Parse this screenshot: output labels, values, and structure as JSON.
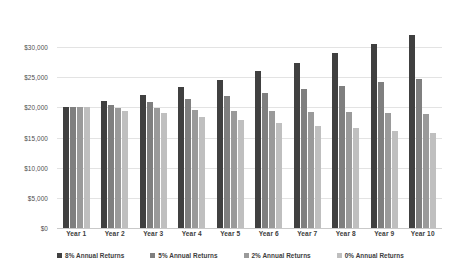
{
  "chart_data": {
    "type": "bar",
    "title": "",
    "subtitle": "",
    "xlabel": "",
    "ylabel": "",
    "categories": [
      "Year 1",
      "Year 2",
      "Year 3",
      "Year 4",
      "Year 5",
      "Year 6",
      "Year 7",
      "Year 8",
      "Year 9",
      "Year 10"
    ],
    "series": [
      {
        "name": "8% Annual Returns",
        "color": "#404040",
        "values": [
          20000,
          21000,
          22100,
          23400,
          24600,
          26000,
          27400,
          29000,
          30550,
          32000
        ]
      },
      {
        "name": "5% Annual Returns",
        "color": "#7f7f7f",
        "values": [
          20000,
          20450,
          20950,
          21400,
          21950,
          22450,
          23100,
          23600,
          24200,
          24800
        ]
      },
      {
        "name": "2% Annual Returns",
        "color": "#9a9a9a",
        "values": [
          20000,
          19950,
          19850,
          19650,
          19450,
          19400,
          19300,
          19200,
          19100,
          18950
        ]
      },
      {
        "name": "0% Annual Returns",
        "color": "#bfbfbf",
        "values": [
          20000,
          19450,
          19000,
          18400,
          17900,
          17500,
          17000,
          16550,
          16150,
          15700
        ]
      }
    ],
    "ylim": [
      0,
      35000
    ],
    "yticks": [
      0,
      5000,
      10000,
      15000,
      20000,
      25000,
      30000
    ],
    "ytick_labels": [
      "$0",
      "$5,000",
      "$10,000",
      "$15,000",
      "$20,000",
      "$25,000",
      "$30,000"
    ],
    "grid": true,
    "legend_position": "bottom",
    "background_color": "#ffffff",
    "gridline_color": "#e3e3e3",
    "axis_text_color": "#3d3d3d"
  }
}
